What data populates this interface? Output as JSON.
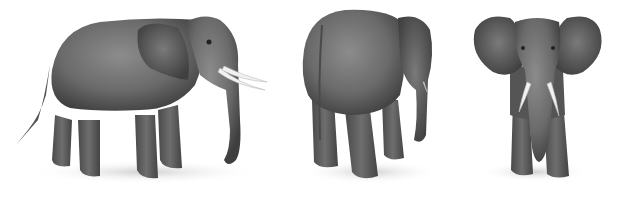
{
  "image": {
    "description": "Three grayscale illustrations of an African elephant from different viewpoints",
    "background": "#ffffff",
    "figures": [
      {
        "view": "side",
        "label": "Elephant side view"
      },
      {
        "view": "rear-three-quarter",
        "label": "Elephant rear three-quarter view"
      },
      {
        "view": "front",
        "label": "Elephant front view"
      }
    ],
    "colors": {
      "body_dark": "#3f3f3f",
      "body_mid": "#6a6a6a",
      "body_light": "#8c8c8c",
      "tusk": "#f2f2f2",
      "shadow": "#d9d9d9"
    }
  }
}
